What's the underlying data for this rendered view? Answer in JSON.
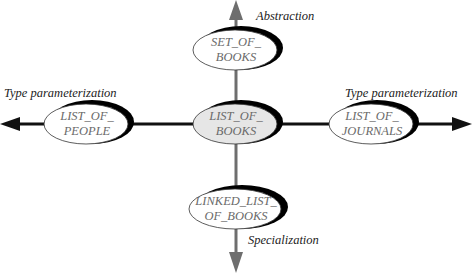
{
  "diagram": {
    "colors": {
      "vertical_axis": "#6e6e6e",
      "horizontal_axis": "#111111",
      "ellipse_fill": "#ffffff",
      "center_fill": "#e6e6e6",
      "ellipse_stroke": "#333333",
      "shadow": "#000000",
      "node_text": "#6a6a6a",
      "label_text": "#222222"
    },
    "nodes": {
      "top": {
        "line1": "SET_OF_",
        "line2": "BOOKS"
      },
      "left": {
        "line1": "LIST_OF_",
        "line2": "PEOPLE"
      },
      "center": {
        "line1": "LIST_OF_",
        "line2": "BOOKS"
      },
      "right": {
        "line1": "LIST_OF_",
        "line2": "JOURNALS"
      },
      "bottom": {
        "line1": "LINKED_LIST_",
        "line2": "OF_BOOKS"
      }
    },
    "edge_labels": {
      "up": "Abstraction",
      "down": "Specialization",
      "left": "Type parameterization",
      "right": "Type parameterization"
    }
  }
}
